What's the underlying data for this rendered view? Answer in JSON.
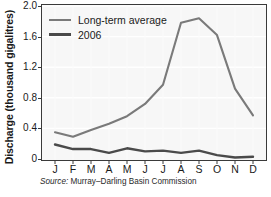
{
  "chart_data": {
    "type": "line",
    "title": "",
    "subtitle": "",
    "xlabel": "",
    "ylabel": "Discharge (thousand gigalitres)",
    "categories": [
      "J",
      "F",
      "M",
      "A",
      "M",
      "J",
      "J",
      "A",
      "S",
      "O",
      "N",
      "D"
    ],
    "series": [
      {
        "name": "Long-term average",
        "color": "#7a7a7a",
        "values": [
          0.35,
          0.29,
          0.38,
          0.46,
          0.56,
          0.72,
          0.97,
          1.78,
          1.84,
          1.62,
          0.92,
          0.57
        ]
      },
      {
        "name": "2006",
        "color": "#4a4a4a",
        "values": [
          0.19,
          0.13,
          0.13,
          0.08,
          0.14,
          0.1,
          0.11,
          0.08,
          0.11,
          0.05,
          0.02,
          0.03
        ]
      }
    ],
    "ylim": [
      0,
      2.0
    ],
    "yticks": [
      "0",
      "0.4",
      "0.8",
      "1.2",
      "1.6",
      "2.0"
    ],
    "ytick_values": [
      0,
      0.4,
      0.8,
      1.2,
      1.6,
      2.0
    ],
    "grid": true,
    "grid_axis": "y",
    "legend_position": "top-left",
    "source": "Source: Murray–Darling Basin Commission",
    "source_prefix": "Source:",
    "source_body": " Murray–Darling Basin Commission",
    "plot_background": "#f7f7f7",
    "grid_color": "#ffffff",
    "axis_color": "#3a3a3a"
  },
  "legend": {
    "items": [
      {
        "label": "Long-term average"
      },
      {
        "label": "2006"
      }
    ]
  }
}
